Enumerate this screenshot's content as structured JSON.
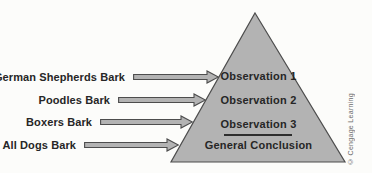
{
  "rows": [
    {
      "label": "German Shepherds Bark",
      "points_to": "Observation 1"
    },
    {
      "label": "Poodles Bark",
      "points_to": "Observation 2"
    },
    {
      "label": "Boxers Bark",
      "points_to": "Observation 3"
    },
    {
      "label": "All Dogs Bark",
      "points_to": "General Conclusion"
    }
  ],
  "pyramid": {
    "levels": [
      "Observation 1",
      "Observation 2",
      "Observation 3"
    ],
    "conclusion": "General Conclusion"
  },
  "credit": "© Cengage Learning",
  "colors": {
    "shape-fill": "#b3b3b3",
    "shape-stroke": "#4d4d4d",
    "text": "#262626",
    "credit-text": "#6b6b6b",
    "background": "#fcfcfa"
  }
}
